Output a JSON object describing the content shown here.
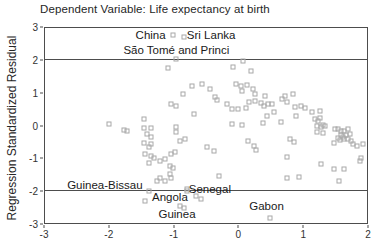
{
  "chart_data": {
    "type": "scatter",
    "title": "Dependent Variable: Life expectancy at birth",
    "xlabel": "",
    "ylabel": "Regression Standardized Residual",
    "xlim": [
      -3,
      2
    ],
    "ylim": [
      -3,
      3
    ],
    "x_ticks": [
      -3,
      -2,
      -1,
      0,
      1,
      2
    ],
    "y_ticks": [
      3,
      2,
      1,
      0,
      -1,
      -2,
      -3
    ],
    "reference_lines_y": [
      2,
      -2
    ],
    "grid": false,
    "legend": "none",
    "marker": "open-square",
    "marker_color": "#a8a8a8",
    "frame_color": "#4d4d4d",
    "points": [
      [
        -1.02,
        2.78
      ],
      [
        -0.84,
        2.72
      ],
      [
        -0.97,
        2.05
      ],
      [
        -1.09,
        1.76
      ],
      [
        -0.08,
        1.81
      ],
      [
        0.08,
        1.97
      ],
      [
        0.2,
        1.69
      ],
      [
        -0.71,
        1.23
      ],
      [
        -0.56,
        1.29
      ],
      [
        -0.44,
        1.13
      ],
      [
        -0.86,
        0.98
      ],
      [
        -0.03,
        1.29
      ],
      [
        0.05,
        1.22
      ],
      [
        0.13,
        1.26
      ],
      [
        0.23,
        1.13
      ],
      [
        0.06,
        1.07
      ],
      [
        -0.36,
        0.89
      ],
      [
        -0.33,
        0.79
      ],
      [
        -0.18,
        0.67
      ],
      [
        -1.05,
        0.67
      ],
      [
        -0.97,
        0.61
      ],
      [
        -0.68,
        0.36
      ],
      [
        0.0,
        0.52
      ],
      [
        0.12,
        0.55
      ],
      [
        0.17,
        0.73
      ],
      [
        0.26,
        0.74
      ],
      [
        0.35,
        0.7
      ],
      [
        0.4,
        0.61
      ],
      [
        0.53,
        0.67
      ],
      [
        0.26,
        0.98
      ],
      [
        0.41,
        0.92
      ],
      [
        0.47,
        0.67
      ],
      [
        0.45,
        0.3
      ],
      [
        0.55,
        0.42
      ],
      [
        0.68,
        0.82
      ],
      [
        0.73,
        0.9
      ],
      [
        0.76,
        0.73
      ],
      [
        0.85,
        0.98
      ],
      [
        0.88,
        0.58
      ],
      [
        0.98,
        0.59
      ],
      [
        1.04,
        0.54
      ],
      [
        1.15,
        0.42
      ],
      [
        1.27,
        0.45
      ],
      [
        0.89,
        0.3
      ],
      [
        1.2,
        0.21
      ],
      [
        1.24,
        0.15
      ],
      [
        1.27,
        0.24
      ],
      [
        -2.0,
        0.05
      ],
      [
        -1.77,
        -0.13
      ],
      [
        -1.72,
        -0.18
      ],
      [
        -1.47,
        0.21
      ],
      [
        -1.47,
        -0.07
      ],
      [
        -1.35,
        -0.07
      ],
      [
        -0.97,
        -0.04
      ],
      [
        -0.97,
        -0.19
      ],
      [
        -0.09,
        0.52
      ],
      [
        -0.09,
        0.05
      ],
      [
        0.06,
        0.02
      ],
      [
        0.39,
        0.08
      ],
      [
        0.67,
        0.11
      ],
      [
        1.23,
        -0.01
      ],
      [
        1.28,
        -0.05
      ],
      [
        1.31,
        0.02
      ],
      [
        1.35,
        -0.01
      ],
      [
        -1.42,
        -0.26
      ],
      [
        -1.35,
        -0.35
      ],
      [
        -0.91,
        -0.47
      ],
      [
        -0.82,
        -0.41
      ],
      [
        -1.47,
        -0.53
      ],
      [
        -1.35,
        -0.56
      ],
      [
        -1.39,
        -0.65
      ],
      [
        -0.48,
        -0.65
      ],
      [
        0.15,
        -0.47
      ],
      [
        0.24,
        -0.62
      ],
      [
        0.27,
        -0.74
      ],
      [
        0.8,
        -0.4
      ],
      [
        0.86,
        -0.52
      ],
      [
        1.23,
        -0.19
      ],
      [
        1.32,
        -0.22
      ],
      [
        1.5,
        -0.1
      ],
      [
        1.55,
        -0.12
      ],
      [
        1.6,
        -0.18
      ],
      [
        1.65,
        -0.16
      ],
      [
        1.7,
        -0.12
      ],
      [
        1.74,
        -0.25
      ],
      [
        1.59,
        -0.3
      ],
      [
        1.63,
        -0.34
      ],
      [
        1.68,
        -0.3
      ],
      [
        1.55,
        -0.38
      ],
      [
        1.58,
        -0.45
      ],
      [
        1.64,
        -0.43
      ],
      [
        1.7,
        -0.42
      ],
      [
        1.75,
        -0.49
      ],
      [
        1.79,
        -0.56
      ],
      [
        1.84,
        -0.62
      ],
      [
        1.94,
        -0.56
      ],
      [
        1.48,
        -0.53
      ],
      [
        -1.44,
        -0.87
      ],
      [
        -1.36,
        -0.93
      ],
      [
        -1.31,
        -0.99
      ],
      [
        -1.05,
        -0.87
      ],
      [
        -0.98,
        -0.81
      ],
      [
        -1.21,
        -1.08
      ],
      [
        -1.14,
        -1.02
      ],
      [
        -0.38,
        -0.77
      ],
      [
        0.76,
        -0.96
      ],
      [
        1.91,
        -0.99
      ],
      [
        -1.39,
        -1.15
      ],
      [
        -1.06,
        -1.24
      ],
      [
        -1.02,
        -1.31
      ],
      [
        -1.06,
        -1.48
      ],
      [
        -1.26,
        -1.7
      ],
      [
        -1.21,
        -1.61
      ],
      [
        -1.14,
        -1.7
      ],
      [
        -1.04,
        -1.61
      ],
      [
        -0.3,
        -1.54
      ],
      [
        0.76,
        -1.63
      ],
      [
        0.95,
        -1.57
      ],
      [
        1.29,
        -1.17
      ],
      [
        1.48,
        -1.33
      ],
      [
        1.64,
        -1.33
      ],
      [
        1.89,
        -1.08
      ],
      [
        1.56,
        -1.72
      ],
      [
        -0.8,
        -1.94
      ],
      [
        -1.44,
        -2.32
      ],
      [
        -1.39,
        -2.0
      ],
      [
        -0.79,
        -2.02
      ],
      [
        -0.65,
        -2.18
      ],
      [
        -0.58,
        -2.25
      ],
      [
        -0.9,
        -2.48
      ],
      [
        -0.84,
        -2.55
      ],
      [
        0.5,
        -2.85
      ]
    ],
    "labeled_points": [
      {
        "label": "China",
        "x": -1.36,
        "y": 2.79
      },
      {
        "label": "Sri Lanka",
        "x": -0.42,
        "y": 2.79
      },
      {
        "label": "São Tomé and Princi",
        "x": -0.96,
        "y": 2.32
      },
      {
        "label": "Guinea-Bissau",
        "x": -2.07,
        "y": -1.84
      },
      {
        "label": "Senegal",
        "x": -0.44,
        "y": -1.96
      },
      {
        "label": "Angola",
        "x": -1.06,
        "y": -2.19
      },
      {
        "label": "Guinea",
        "x": -0.95,
        "y": -2.73
      },
      {
        "label": "Gabon",
        "x": 0.44,
        "y": -2.48
      }
    ]
  }
}
